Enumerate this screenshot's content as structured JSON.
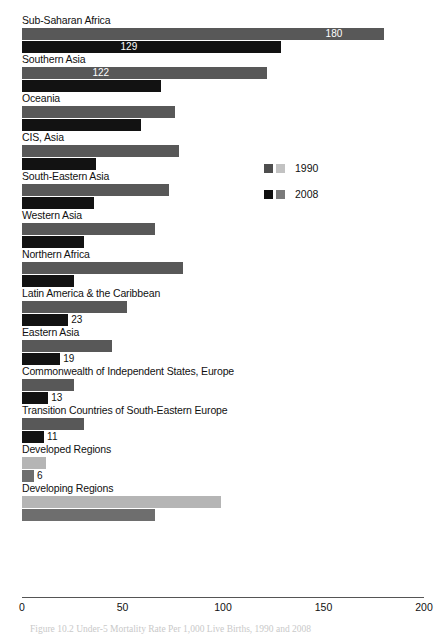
{
  "chart_data": {
    "type": "bar",
    "orientation": "horizontal",
    "title": "",
    "caption": "Figure 10.2 Under-5 Mortality Rate Per 1,000 Live Births, 1990 and 2008",
    "xlabel": "",
    "ylabel": "",
    "xlim": [
      0,
      200
    ],
    "xticks": [
      0,
      50,
      100,
      150,
      200
    ],
    "xtick_labels": [
      "0",
      "50",
      "100",
      "150",
      "200"
    ],
    "grid": false,
    "legend_position": "center-right",
    "series": [
      {
        "name": "1990",
        "color": "#585858",
        "alt_color": "#b5b5b5",
        "values": [
          180,
          122,
          76,
          78,
          73,
          66,
          80,
          52,
          45,
          26,
          31,
          12,
          99
        ]
      },
      {
        "name": "2008",
        "color": "#121212",
        "alt_color": "#6e6e6e",
        "values": [
          129,
          69,
          59,
          37,
          36,
          31,
          26,
          23,
          19,
          13,
          11,
          6,
          66
        ]
      }
    ],
    "categories": [
      "Sub-Saharan Africa",
      "Southern Asia",
      "Oceania",
      "CIS, Asia",
      "South-Eastern Asia",
      "Western Asia",
      "Northern Africa",
      "Latin America & the Caribbean",
      "Eastern Asia",
      "Commonwealth of Independent States, Europe",
      "Transition Countries of South-Eastern Europe",
      "Developed Regions",
      "Developing Regions"
    ],
    "groups": [
      {
        "label": "Sub-Saharan Africa",
        "shade": "dark",
        "bars": [
          {
            "series": "1990",
            "value": 180,
            "value_label": "180",
            "label_position": "inside"
          },
          {
            "series": "2008",
            "value": 129,
            "value_label": "129",
            "label_position": "inside"
          }
        ]
      },
      {
        "label": "Southern Asia",
        "shade": "dark",
        "bars": [
          {
            "series": "1990",
            "value": 122,
            "value_label": "122",
            "label_position": "inside"
          },
          {
            "series": "2008",
            "value": 69,
            "value_label": "69",
            "label_position": "inside"
          }
        ]
      },
      {
        "label": "Oceania",
        "shade": "dark",
        "bars": [
          {
            "series": "1990",
            "value": 76,
            "value_label": "76",
            "label_position": "inside"
          },
          {
            "series": "2008",
            "value": 59,
            "value_label": "59",
            "label_position": "inside"
          }
        ]
      },
      {
        "label": "CIS, Asia",
        "shade": "dark",
        "bars": [
          {
            "series": "1990",
            "value": 78,
            "value_label": "78",
            "label_position": "inside"
          },
          {
            "series": "2008",
            "value": 37,
            "value_label": "37",
            "label_position": "inside"
          }
        ]
      },
      {
        "label": "South-Eastern Asia",
        "shade": "dark",
        "bars": [
          {
            "series": "1990",
            "value": 73,
            "value_label": "73",
            "label_position": "inside"
          },
          {
            "series": "2008",
            "value": 36,
            "value_label": "36",
            "label_position": "inside"
          }
        ]
      },
      {
        "label": "Western Asia",
        "shade": "dark",
        "bars": [
          {
            "series": "1990",
            "value": 66,
            "value_label": "66",
            "label_position": "inside"
          },
          {
            "series": "2008",
            "value": 31,
            "value_label": "31",
            "label_position": "inside"
          }
        ]
      },
      {
        "label": "Northern Africa",
        "shade": "dark",
        "bars": [
          {
            "series": "1990",
            "value": 80,
            "value_label": "80",
            "label_position": "inside"
          },
          {
            "series": "2008",
            "value": 26,
            "value_label": "26",
            "label_position": "inside"
          }
        ]
      },
      {
        "label": "Latin America & the Caribbean",
        "shade": "dark",
        "bars": [
          {
            "series": "1990",
            "value": 52,
            "value_label": "52",
            "label_position": "inside"
          },
          {
            "series": "2008",
            "value": 23,
            "value_label": "23",
            "label_position": "outside"
          }
        ]
      },
      {
        "label": "Eastern Asia",
        "shade": "dark",
        "bars": [
          {
            "series": "1990",
            "value": 45,
            "value_label": "45",
            "label_position": "inside"
          },
          {
            "series": "2008",
            "value": 19,
            "value_label": "19",
            "label_position": "outside"
          }
        ]
      },
      {
        "label": "Commonwealth of Independent States, Europe",
        "shade": "dark",
        "bars": [
          {
            "series": "1990",
            "value": 26,
            "value_label": "26",
            "label_position": "inside"
          },
          {
            "series": "2008",
            "value": 13,
            "value_label": "13",
            "label_position": "outside"
          }
        ]
      },
      {
        "label": "Transition Countries of South-Eastern Europe",
        "shade": "dark",
        "bars": [
          {
            "series": "1990",
            "value": 31,
            "value_label": "31",
            "label_position": "inside"
          },
          {
            "series": "2008",
            "value": 11,
            "value_label": "11",
            "label_position": "outside"
          }
        ]
      },
      {
        "label": "Developed Regions",
        "shade": "light",
        "bars": [
          {
            "series": "1990",
            "value": 12,
            "value_label": "12",
            "label_position": "inside"
          },
          {
            "series": "2008",
            "value": 6,
            "value_label": "6",
            "label_position": "outside"
          }
        ]
      },
      {
        "label": "Developing Regions",
        "shade": "light",
        "bars": [
          {
            "series": "1990",
            "value": 99,
            "value_label": "99",
            "label_position": "inside"
          },
          {
            "series": "2008",
            "value": 66,
            "value_label": "66",
            "label_position": "inside"
          }
        ]
      }
    ],
    "legend": [
      {
        "label": "1990",
        "swatch_a": "#4e4e4e",
        "swatch_b": "#c2c2c2"
      },
      {
        "label": "2008",
        "swatch_a": "#0f0f0f",
        "swatch_b": "#7a7a7a"
      }
    ]
  }
}
